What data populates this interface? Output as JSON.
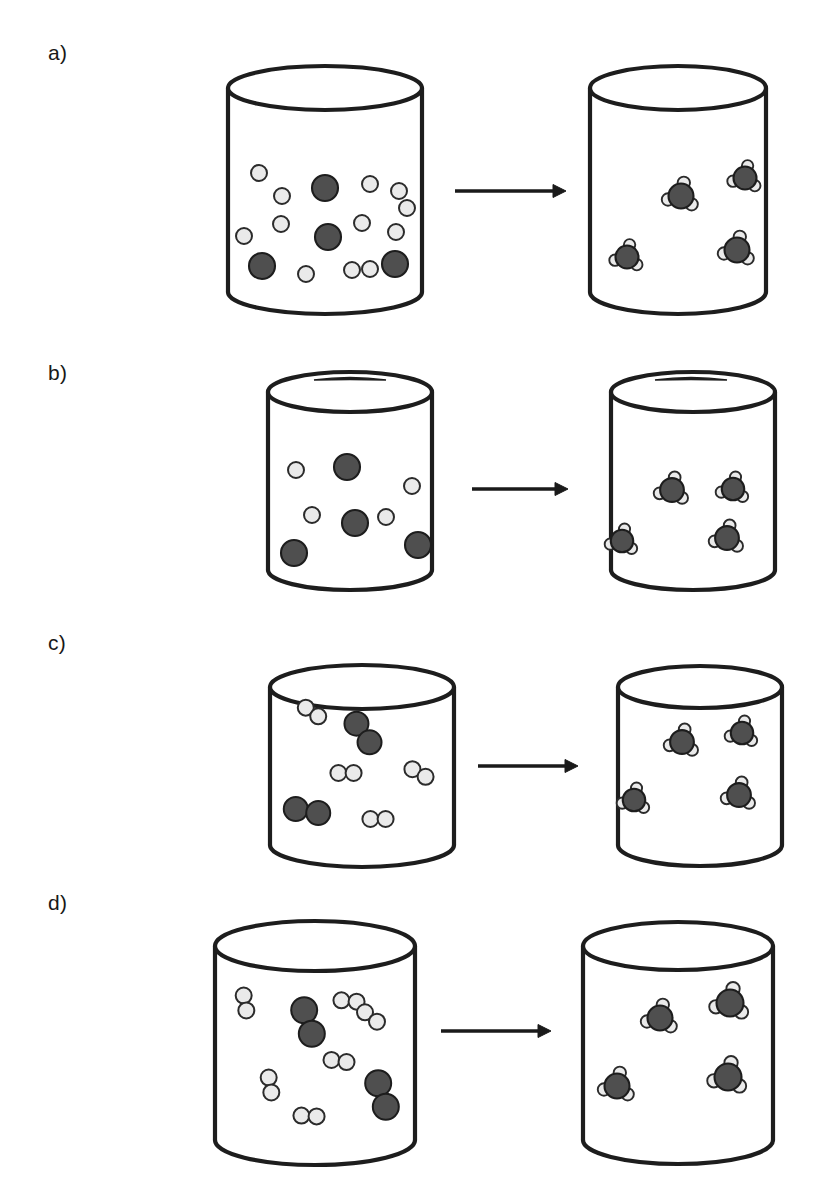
{
  "figure": {
    "title_fragment_clipped": "",
    "background_color": "#ffffff",
    "width": 823,
    "height": 1182,
    "stroke_color": "#1d1d1d",
    "dark_atom_fill": "#4f4f4f",
    "dark_atom_stroke": "#1d1d1d",
    "light_atom_fill": "#eaeaea",
    "light_atom_stroke": "#2b2b2b",
    "vessel_fill": "#ffffff",
    "arrow_color": "#1a1a1a"
  },
  "panels": [
    {
      "label": "a)",
      "label_x": 48,
      "label_y": 42,
      "has_lid": false,
      "arrow": {
        "x1": 455,
        "y1": 191,
        "x2": 566,
        "y2": 191
      },
      "left_vessel": {
        "cx": 325,
        "top_y": 88,
        "bottom_y": 292,
        "rx": 97,
        "ry": 22,
        "name": "reactant-vessel",
        "contents_description": "loose hydrogen atoms and nitrogen atoms",
        "dark_atoms": [
          {
            "x": 325,
            "y": 188,
            "r": 13
          },
          {
            "x": 328,
            "y": 237,
            "r": 13
          },
          {
            "x": 262,
            "y": 266,
            "r": 13
          },
          {
            "x": 395,
            "y": 264,
            "r": 13
          }
        ],
        "light_atoms": [
          {
            "x": 259,
            "y": 173,
            "r": 8
          },
          {
            "x": 282,
            "y": 196,
            "r": 8
          },
          {
            "x": 281,
            "y": 224,
            "r": 8
          },
          {
            "x": 244,
            "y": 236,
            "r": 8
          },
          {
            "x": 306,
            "y": 274,
            "r": 8
          },
          {
            "x": 291,
            "y": 272,
            "r": 0
          },
          {
            "x": 352,
            "y": 270,
            "r": 8
          },
          {
            "x": 370,
            "y": 184,
            "r": 8
          },
          {
            "x": 399,
            "y": 191,
            "r": 8
          },
          {
            "x": 407,
            "y": 208,
            "r": 8
          },
          {
            "x": 362,
            "y": 223,
            "r": 8
          },
          {
            "x": 396,
            "y": 232,
            "r": 8
          },
          {
            "x": 370,
            "y": 269,
            "r": 8
          }
        ]
      },
      "right_vessel": {
        "cx": 678,
        "top_y": 88,
        "bottom_y": 292,
        "rx": 88,
        "ry": 22,
        "name": "product-vessel",
        "contents_description": "four ammonia molecules",
        "molecules": [
          {
            "x": 681,
            "y": 196,
            "s": 1.0
          },
          {
            "x": 745,
            "y": 178,
            "s": 0.92
          },
          {
            "x": 627,
            "y": 257,
            "s": 0.92
          },
          {
            "x": 737,
            "y": 250,
            "s": 1.0
          }
        ]
      }
    },
    {
      "label": "b)",
      "label_x": 48,
      "label_y": 362,
      "has_lid": true,
      "arrow": {
        "x1": 472,
        "y1": 489,
        "x2": 568,
        "y2": 489
      },
      "left_vessel": {
        "cx": 350,
        "top_y": 392,
        "bottom_y": 570,
        "rx": 82,
        "ry": 20,
        "lid": {
          "x": 350,
          "y": 378,
          "half_width": 36
        },
        "name": "reactant-vessel",
        "contents_description": "few hydrogen atoms and nitrogen atoms",
        "dark_atoms": [
          {
            "x": 347,
            "y": 467,
            "r": 13
          },
          {
            "x": 355,
            "y": 523,
            "r": 13
          },
          {
            "x": 294,
            "y": 553,
            "r": 13
          },
          {
            "x": 418,
            "y": 545,
            "r": 13
          }
        ],
        "light_atoms": [
          {
            "x": 296,
            "y": 470,
            "r": 8
          },
          {
            "x": 412,
            "y": 486,
            "r": 8
          },
          {
            "x": 312,
            "y": 515,
            "r": 8
          },
          {
            "x": 386,
            "y": 517,
            "r": 8
          }
        ]
      },
      "right_vessel": {
        "cx": 693,
        "top_y": 392,
        "bottom_y": 570,
        "rx": 82,
        "ry": 20,
        "lid": {
          "x": 691,
          "y": 378,
          "half_width": 36
        },
        "name": "product-vessel",
        "contents_description": "four ammonia molecules",
        "molecules": [
          {
            "x": 672,
            "y": 490,
            "s": 0.95
          },
          {
            "x": 733,
            "y": 489,
            "s": 0.9
          },
          {
            "x": 622,
            "y": 541,
            "s": 0.9
          },
          {
            "x": 727,
            "y": 538,
            "s": 0.95
          }
        ]
      }
    },
    {
      "label": "c)",
      "label_x": 48,
      "label_y": 632,
      "has_lid": false,
      "arrow": {
        "x1": 478,
        "y1": 766,
        "x2": 578,
        "y2": 766
      },
      "left_vessel": {
        "cx": 362,
        "top_y": 687,
        "bottom_y": 845,
        "rx": 92,
        "ry": 22,
        "name": "reactant-vessel",
        "contents_description": "hydrogen molecules and nitrogen molecules",
        "dark_pairs": [
          {
            "x": 363,
            "y": 733,
            "angle": 55,
            "r": 12
          },
          {
            "x": 307,
            "y": 811,
            "angle": 10,
            "r": 12
          }
        ],
        "light_pairs": [
          {
            "x": 312,
            "y": 712,
            "angle": 35,
            "r": 8
          },
          {
            "x": 346,
            "y": 773,
            "angle": 0,
            "r": 8
          },
          {
            "x": 419,
            "y": 773,
            "angle": 30,
            "r": 8
          },
          {
            "x": 378,
            "y": 819,
            "angle": 0,
            "r": 8
          }
        ]
      },
      "right_vessel": {
        "cx": 700,
        "top_y": 687,
        "bottom_y": 845,
        "rx": 82,
        "ry": 21,
        "name": "product-vessel",
        "contents_description": "four ammonia molecules",
        "molecules": [
          {
            "x": 682,
            "y": 742,
            "s": 0.95
          },
          {
            "x": 742,
            "y": 733,
            "s": 0.9
          },
          {
            "x": 634,
            "y": 800,
            "s": 0.9
          },
          {
            "x": 739,
            "y": 795,
            "s": 0.95
          }
        ]
      }
    },
    {
      "label": "d)",
      "label_x": 48,
      "label_y": 892,
      "has_lid": false,
      "arrow": {
        "x1": 441,
        "y1": 1031,
        "x2": 551,
        "y2": 1031
      },
      "left_vessel": {
        "cx": 315,
        "top_y": 946,
        "bottom_y": 1140,
        "rx": 100,
        "ry": 25,
        "name": "reactant-vessel",
        "contents_description": "many hydrogen molecules and nitrogen molecules",
        "dark_pairs": [
          {
            "x": 308,
            "y": 1022,
            "angle": 72,
            "r": 13
          },
          {
            "x": 382,
            "y": 1095,
            "angle": 72,
            "r": 13
          }
        ],
        "light_pairs": [
          {
            "x": 245,
            "y": 1003,
            "angle": 80,
            "r": 8
          },
          {
            "x": 349,
            "y": 1001,
            "angle": 5,
            "r": 8
          },
          {
            "x": 371,
            "y": 1017,
            "angle": 38,
            "r": 8
          },
          {
            "x": 339,
            "y": 1061,
            "angle": 8,
            "r": 8
          },
          {
            "x": 270,
            "y": 1085,
            "angle": 80,
            "r": 8
          },
          {
            "x": 309,
            "y": 1116,
            "angle": 3,
            "r": 8
          }
        ]
      },
      "right_vessel": {
        "cx": 678,
        "top_y": 946,
        "bottom_y": 1140,
        "rx": 95,
        "ry": 24,
        "name": "product-vessel",
        "contents_description": "four ammonia molecules",
        "molecules": [
          {
            "x": 660,
            "y": 1018,
            "s": 1.0
          },
          {
            "x": 730,
            "y": 1003,
            "s": 1.08
          },
          {
            "x": 617,
            "y": 1086,
            "s": 1.0
          },
          {
            "x": 728,
            "y": 1077,
            "s": 1.08
          }
        ]
      }
    }
  ]
}
